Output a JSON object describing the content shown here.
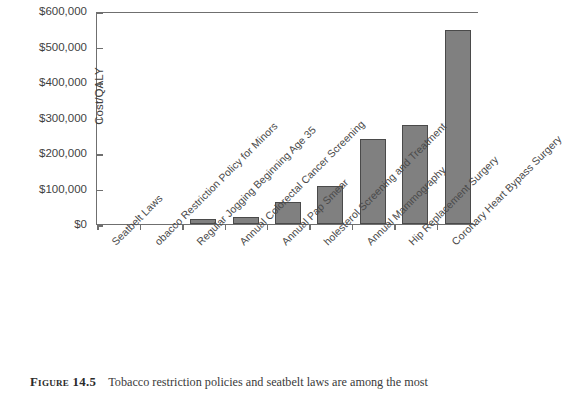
{
  "chart_data": {
    "type": "bar",
    "title": "",
    "xlabel": "",
    "ylabel": "Cost/QALY",
    "ylim": [
      0,
      600000
    ],
    "grid": false,
    "legend": "none",
    "bar_color": "#808080",
    "bar_edge_color": "#4a4a4a",
    "y_tick_labels": [
      "$0",
      "$100,000",
      "$200,000",
      "$300,000",
      "$400,000",
      "$500,000",
      "$600,000"
    ],
    "y_tick_values": [
      0,
      100000,
      200000,
      300000,
      400000,
      500000,
      600000
    ],
    "categories": [
      "Seatbelt Laws",
      "Tobacco Restriction Policy for Minors",
      "Regular Jogging Beginning Age 35",
      "Annual Colorectal Cancer Screening",
      "Annual Pap Smear",
      "Cholesterol Screening and Treatment",
      "Annual Mammography",
      "Hip Replacement Surgery",
      "Coronary Heart Bypass Surgery"
    ],
    "categories_as_rendered": [
      "Seatbelt Laws",
      "obacco Restriction Policy for Minors",
      "Regular Jogging Beginning Age 35",
      "Annual Colorectal Cancer Screening",
      "Annual Pap Smear",
      "holesterol Screening and Treatment",
      "Annual Mammography",
      "Hip Replacement Surgery",
      "Coronary Heart Bypass Surgery"
    ],
    "values": [
      0,
      3000,
      14000,
      20000,
      62000,
      107000,
      240000,
      278000,
      547000
    ]
  },
  "caption": {
    "figure_label": "Figure 14.5",
    "text": "Tobacco restriction policies and seatbelt laws are among the most"
  }
}
